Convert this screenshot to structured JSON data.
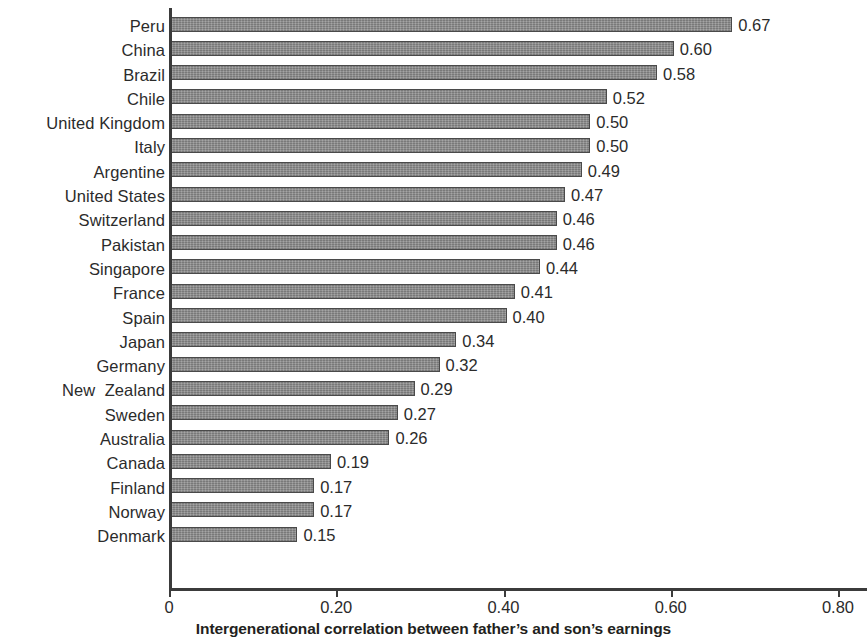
{
  "chart_data": {
    "type": "bar",
    "orientation": "horizontal",
    "title": "",
    "xlabel": "Intergenerational correlation between father’s and son’s earnings",
    "ylabel": "",
    "xlim": [
      0,
      0.8
    ],
    "xticks": [
      "0",
      "0.20",
      "0.40",
      "0.60",
      "0.80"
    ],
    "xtick_values": [
      0,
      0.2,
      0.4,
      0.6,
      0.8
    ],
    "grid": false,
    "legend": null,
    "bar_color": "#8d8d8d",
    "bar_border_color": "#4a4a4a",
    "axis_color": "#3b3b3b",
    "text_color": "#2b2b2b",
    "categories": [
      "Peru",
      "China",
      "Brazil",
      "Chile",
      "United Kingdom",
      "Italy",
      "Argentine",
      "United States",
      "Switzerland",
      "Pakistan",
      "Singapore",
      "France",
      "Spain",
      "Japan",
      "Germany",
      "New  Zealand",
      "Sweden",
      "Australia",
      "Canada",
      "Finland",
      "Norway",
      "Denmark"
    ],
    "values": [
      0.67,
      0.6,
      0.58,
      0.52,
      0.5,
      0.5,
      0.49,
      0.47,
      0.46,
      0.46,
      0.44,
      0.41,
      0.4,
      0.34,
      0.32,
      0.29,
      0.27,
      0.26,
      0.19,
      0.17,
      0.17,
      0.15
    ],
    "value_labels": [
      "0.67",
      "0.60",
      "0.58",
      "0.52",
      "0.50",
      "0.50",
      "0.49",
      "0.47",
      "0.46",
      "0.46",
      "0.44",
      "0.41",
      "0.40",
      "0.34",
      "0.32",
      "0.29",
      "0.27",
      "0.26",
      "0.19",
      "0.17",
      "0.17",
      "0.15"
    ]
  }
}
